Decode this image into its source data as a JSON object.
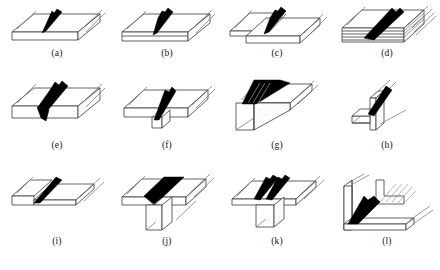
{
  "figure": {
    "background_color": "#ffffff",
    "line_color": "#3a3a3a",
    "weld_color": "#000000",
    "columns": 4,
    "rows": 3,
    "panels": [
      {
        "id": "a",
        "caption": "(a)",
        "joint_name": "square-butt-joint",
        "description": "Two flat plates butted edge to edge with a single square butt weld bead",
        "weld_count": 1,
        "plate_count": 2
      },
      {
        "id": "b",
        "caption": "(b)",
        "joint_name": "butt-joint-with-root-gap",
        "description": "Butt joint between plates of stepped thickness with a single weld bead",
        "weld_count": 1,
        "plate_count": 2
      },
      {
        "id": "c",
        "caption": "(c)",
        "joint_name": "lap-joint",
        "description": "Overlapping plates joined with a single fillet weld along the overlapping edge",
        "weld_count": 1,
        "plate_count": 2
      },
      {
        "id": "d",
        "caption": "(d)",
        "joint_name": "multi-layer-laminated-joint",
        "description": "Stack of several thin laminations welded through with a broad bevel weld",
        "weld_count": 1,
        "plate_count": 5
      },
      {
        "id": "e",
        "caption": "(e)",
        "joint_name": "double-v-butt-joint",
        "description": "Butt joint with full penetration weld showing reinforcement on top and root on bottom",
        "weld_count": 1,
        "plate_count": 2
      },
      {
        "id": "f",
        "caption": "(f)",
        "joint_name": "butt-joint-with-backing-strip",
        "description": "Butt weld made against a backing strip fitted beneath the joint line",
        "weld_count": 1,
        "plate_count": 3
      },
      {
        "id": "g",
        "caption": "(g)",
        "joint_name": "corner-joint",
        "description": "Two plates meeting at a right-angle corner with a bevel weld across the outside corner",
        "weld_count": 1,
        "plate_count": 2
      },
      {
        "id": "h",
        "caption": "(h)",
        "joint_name": "t-joint-edge-view",
        "description": "Upstanding web plate welded to a flange, seen end on, with one inclined weld",
        "weld_count": 1,
        "plate_count": 2
      },
      {
        "id": "i",
        "caption": "(i)",
        "joint_name": "edge-flange-joint",
        "description": "Thin plate joined to the edge of a second plate with one inclined weld bead",
        "weld_count": 1,
        "plate_count": 2
      },
      {
        "id": "j",
        "caption": "(j)",
        "joint_name": "t-joint-with-v-groove",
        "description": "Tee joint with a prepared V groove welded from the top of the flange",
        "weld_count": 1,
        "plate_count": 2
      },
      {
        "id": "k",
        "caption": "(k)",
        "joint_name": "t-joint-double-fillet",
        "description": "Tee joint with two fillet welds, one on each side of the upright web",
        "weld_count": 2,
        "plate_count": 2
      },
      {
        "id": "l",
        "caption": "(l)",
        "joint_name": "corner-joint-inside-fillet",
        "description": "Right-angle corner joint welded on the inside with a fillet, inset detail shows section",
        "weld_count": 1,
        "plate_count": 2
      }
    ]
  }
}
